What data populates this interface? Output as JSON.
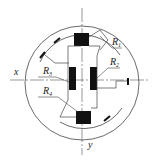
{
  "diagram": {
    "type": "strain-gauge-bridge-layout",
    "axes": {
      "x_label": "x",
      "y_label": "y"
    },
    "resistors": [
      {
        "id": "R1",
        "label": "R",
        "sub": "1",
        "position": "top-right"
      },
      {
        "id": "R2",
        "label": "R",
        "sub": "2",
        "position": "right"
      },
      {
        "id": "R3",
        "label": "R",
        "sub": "3",
        "position": "left-upper"
      },
      {
        "id": "R4",
        "label": "R",
        "sub": "4",
        "position": "left-lower"
      }
    ],
    "colors": {
      "stroke": "#333333",
      "fill": "#111111",
      "background": "#ffffff"
    }
  }
}
